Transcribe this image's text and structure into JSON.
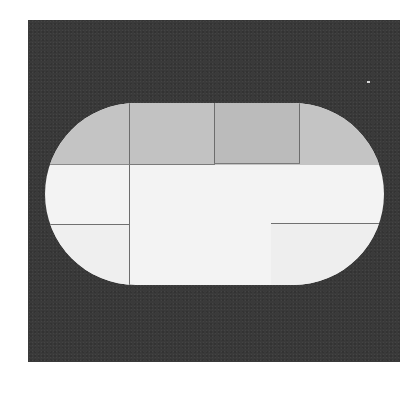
{
  "image": {
    "description": "Grayscale photograph of a stadium (rounded-rectangle) shaped panel on a dark textured background, divided into rectangular sections by thin lines",
    "colors": {
      "page_background": "#ffffff",
      "frame": "#3a3a3a",
      "top_band": "#c4c4c4",
      "lower_field": "#f3f3f3",
      "divider_lines": "#6d6d6d"
    },
    "regions": {
      "top_band_sections": 4,
      "lower_sections": [
        "left-upper",
        "left-lower",
        "center",
        "right-upper",
        "right-lower"
      ]
    }
  }
}
